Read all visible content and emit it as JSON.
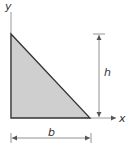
{
  "diagram": {
    "axes": {
      "x_label": "x",
      "y_label": "y"
    },
    "dimensions": {
      "height_label": "h",
      "base_label": "b"
    },
    "colors": {
      "fill": "#cfcfcf",
      "stroke": "#333333",
      "axis": "#888888",
      "dim": "#777777"
    }
  }
}
